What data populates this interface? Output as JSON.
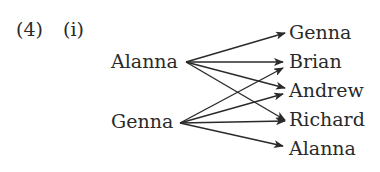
{
  "question": {
    "number": "(4)",
    "part": "(i)"
  },
  "diagram": {
    "type": "arrow-mapping",
    "domain": [
      "Alanna",
      "Genna"
    ],
    "codomain": [
      "Genna",
      "Brian",
      "Andrew",
      "Richard",
      "Alanna"
    ],
    "arrows": [
      {
        "from": "Alanna",
        "to": "Genna"
      },
      {
        "from": "Alanna",
        "to": "Brian"
      },
      {
        "from": "Alanna",
        "to": "Andrew"
      },
      {
        "from": "Alanna",
        "to": "Richard"
      },
      {
        "from": "Genna",
        "to": "Brian"
      },
      {
        "from": "Genna",
        "to": "Andrew"
      },
      {
        "from": "Genna",
        "to": "Richard"
      },
      {
        "from": "Genna",
        "to": "Alanna"
      }
    ],
    "colors": {
      "ink": "#2a2a2a",
      "background": "#ffffff"
    }
  }
}
